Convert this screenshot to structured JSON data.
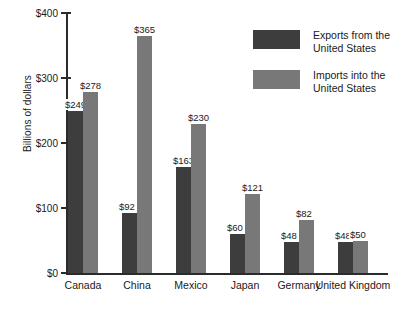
{
  "chart_data": {
    "type": "bar",
    "title": "",
    "xlabel": "",
    "ylabel": "Billions of dollars",
    "ylim": [
      0,
      400
    ],
    "yticks": [
      0,
      100,
      200,
      300,
      400
    ],
    "ytick_labels": [
      "$0",
      "$100",
      "$200",
      "$300",
      "$400"
    ],
    "grid": false,
    "legend_position": "top-right",
    "value_prefix": "$",
    "categories": [
      "Canada",
      "China",
      "Mexico",
      "Japan",
      "Germany",
      "United Kingdom"
    ],
    "series": [
      {
        "name": "Exports from the United States",
        "color": "#3d3d3d",
        "values": [
          249,
          92,
          163,
          60,
          48,
          48
        ],
        "labels": [
          "$249",
          "$92",
          "$163",
          "$60",
          "$48",
          "$48"
        ]
      },
      {
        "name": "Imports into the United States",
        "color": "#787878",
        "values": [
          278,
          365,
          230,
          121,
          82,
          50
        ],
        "labels": [
          "$278",
          "$365",
          "$230",
          "$121",
          "$82",
          "$50"
        ]
      }
    ]
  },
  "axis": {
    "y_title": "Billions of dollars",
    "ticks": [
      {
        "label": "$400",
        "value": 400
      },
      {
        "label": "$300",
        "value": 300
      },
      {
        "label": "$200",
        "value": 200
      },
      {
        "label": "$100",
        "value": 100
      },
      {
        "label": "$0",
        "value": 0
      }
    ]
  },
  "categories": [
    {
      "label": "Canada"
    },
    {
      "label": "China"
    },
    {
      "label": "Mexico"
    },
    {
      "label": "Japan"
    },
    {
      "label": "Germany"
    },
    {
      "label": "United Kingdom"
    }
  ],
  "legend": {
    "items": [
      {
        "label": "Exports from the United States",
        "color": "#3d3d3d"
      },
      {
        "label": "Imports into the United States",
        "color": "#787878"
      }
    ]
  }
}
